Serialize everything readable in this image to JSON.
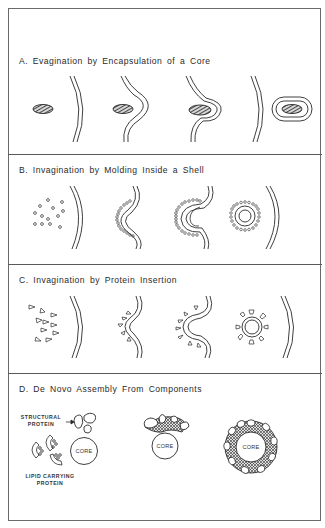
{
  "panels": [
    {
      "id": "A",
      "title": "A. Evagination by Encapsulation of a Core"
    },
    {
      "id": "B",
      "title": "B. Invagination by Molding Inside a Shell"
    },
    {
      "id": "C",
      "title": "C. Invagination by Protein Insertion"
    },
    {
      "id": "D",
      "title": "D. De Novo Assembly From Components"
    }
  ],
  "labels": {
    "structural_protein_line1": "STRUCTURAL",
    "structural_protein_line2": "PROTEIN",
    "lipid_carrying_line1": "LIPID CARRYING",
    "lipid_carrying_line2": "PROTEIN",
    "core": "CORE"
  },
  "colors": {
    "ink": "#2a2a2a",
    "border": "#6a6a6a",
    "background": "#ffffff"
  }
}
